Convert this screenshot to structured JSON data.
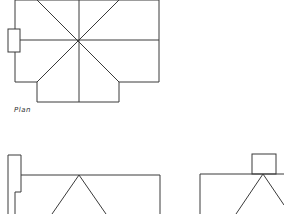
{
  "diagram": {
    "type": "architectural-drawing",
    "views": [
      {
        "name": "plan",
        "label": "Plan"
      },
      {
        "name": "side-elevation",
        "label": ""
      },
      {
        "name": "end-elevation",
        "label": ""
      }
    ],
    "line_color": "#3a3a3a",
    "background": "#ffffff"
  }
}
